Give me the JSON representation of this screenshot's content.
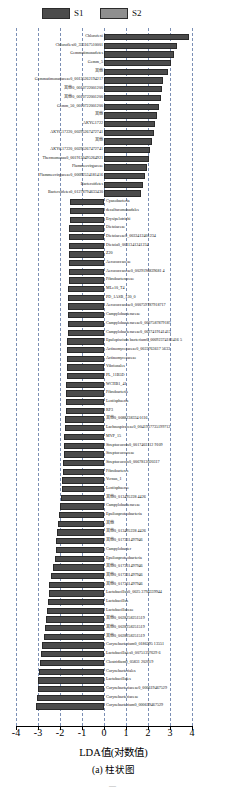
{
  "legend": {
    "items": [
      {
        "label": "S1",
        "color": "#4b4b4b"
      },
      {
        "label": "S2",
        "color": "#8f8f8f"
      }
    ]
  },
  "axis": {
    "xlabel": "LDA值(对数值)",
    "ticks": [
      "-4",
      "-3",
      "-2",
      "-1",
      "0",
      "1",
      "2",
      "3",
      "4"
    ],
    "xmin": -4,
    "xmax": 4
  },
  "caption": "(a) 柱状图",
  "pagemark": "—",
  "chart_data": {
    "type": "bar",
    "title": "",
    "xlabel": "LDA值(对数值)",
    "ylabel": "",
    "xlim": [
      -4,
      4
    ],
    "grid": true,
    "legend_position": "top-left",
    "orientation": "horizontal",
    "series": [
      {
        "name": "S1",
        "color": "#4b4b4b"
      },
      {
        "name": "S2",
        "color": "#8f8f8f"
      }
    ],
    "categories": [
      "Chlorofexi",
      "Chloroflexi0_353167510001",
      "Gemmatimonadetes",
      "Gemm_5",
      "其他",
      "Gemmatimonadaceae0_00135262194217",
      "其他0_0010722001200",
      "其他0_0010722001200",
      "Gemm_50_0010722001200",
      "其他",
      "AKYG1722",
      "AKYG17220_00295267472741",
      "其他",
      "AKYG17220_00295267472741",
      "Thermomonas0_0019130495264921",
      "Flammeovirgaceae",
      "Flammeovirgaceae0_00092534181416",
      "Bacteroidetes",
      "Bacteroidetes0_01278794633430",
      "Cyanobacteria",
      "desulfuromonadales",
      "Erysipelotrichi",
      "Dietziaceae",
      "Dietziaceae0_0033412401234",
      "Dietzia0_0031341241234",
      "Z20",
      "Aerococcaceae",
      "Aerococcaceae0_0029196839681 4",
      "Fibrobacteraceae",
      "MLe10_T4",
      "PD_1ASB_130_0",
      "Aerococcaceae0_000759787918717",
      "Campylobacteraceae",
      "Campylobacteraceae0_0007587879187",
      "Campylobacteraceae0_0027419141413",
      "Epulopiscium bacterium0_00092374181416 5",
      "Actinomycetaceae0_0022763617 5633",
      "Actinomycetaceae",
      "Vibrionales",
      "PL_11B5D",
      "WCHB1_41",
      "Fibrobacteria",
      "Lentisphaeria",
      "RF3",
      "其他0_0088238334 0116",
      "Lachnospiraceae0_0041937735199712",
      "MVP_15",
      "Streptococcus0_0017403112 9109",
      "Streptococcaceae",
      "Streptococcus0_0067813020317",
      "Fibrobacteres",
      "Vernus_1",
      "Lentisphaerae",
      "其他0_013495228 4426",
      "Campylobacteraceae",
      "Epsilonproteobacteria",
      "其他",
      "其他0_013495228 4426",
      "其他0_017331497946",
      "Campylobacter",
      "Epsilonproteobacteria",
      "其他0_017331497946",
      "其他0_017331497946",
      "其他0_017331497946",
      "Lactobacillus0_0025 3794339944",
      "Lactobacillus",
      "Lactobacillaceae",
      "其他0_0028258251519",
      "其他0_0028258251519",
      "其他0_0028258251519",
      "Corynebacterium0_0186295 13551",
      "Lactobacillales0_00751397629 6",
      "Clostridium0_05831 202019",
      "Corynebacteriales",
      "Lactobacillales",
      "Corynebacteriaceae0_000619467529",
      "Corynebacteriaceae",
      "Corynebacterium0_000619467529"
    ],
    "values": [
      3.88,
      3.32,
      3.18,
      3.05,
      2.93,
      2.7,
      2.62,
      2.58,
      2.52,
      2.4,
      2.32,
      2.25,
      2.18,
      2.11,
      2.05,
      1.97,
      1.88,
      1.78,
      1.68,
      -1.55,
      -1.55,
      -1.56,
      -1.57,
      -1.58,
      -1.58,
      -1.59,
      -1.6,
      -1.6,
      -1.61,
      -1.62,
      -1.62,
      -1.63,
      -1.64,
      -1.64,
      -1.65,
      -1.66,
      -1.67,
      -1.68,
      -1.69,
      -1.7,
      -1.71,
      -1.72,
      -1.73,
      -1.74,
      -1.76,
      -1.78,
      -1.8,
      -1.82,
      -1.84,
      -1.86,
      -1.88,
      -1.9,
      -1.93,
      -1.96,
      -2.0,
      -2.04,
      -2.08,
      -2.12,
      -2.16,
      -2.2,
      -2.25,
      -2.32,
      -2.4,
      -2.48,
      -2.52,
      -2.56,
      -2.6,
      -2.64,
      -2.68,
      -2.72,
      -2.8,
      -2.86,
      -2.9,
      -2.95,
      -2.98,
      -3.02,
      -3.06,
      -3.1
    ],
    "group": [
      "S1",
      "S1",
      "S1",
      "S1",
      "S1",
      "S1",
      "S1",
      "S1",
      "S1",
      "S1",
      "S1",
      "S1",
      "S1",
      "S1",
      "S1",
      "S1",
      "S1",
      "S1",
      "S1",
      "S2",
      "S2",
      "S2",
      "S2",
      "S2",
      "S2",
      "S2",
      "S2",
      "S2",
      "S2",
      "S2",
      "S2",
      "S2",
      "S2",
      "S2",
      "S2",
      "S2",
      "S2",
      "S2",
      "S2",
      "S2",
      "S2",
      "S2",
      "S2",
      "S2",
      "S2",
      "S2",
      "S2",
      "S2",
      "S2",
      "S2",
      "S2",
      "S2",
      "S2",
      "S2",
      "S2",
      "S2",
      "S2",
      "S2",
      "S2",
      "S2",
      "S2",
      "S2",
      "S2",
      "S2",
      "S2",
      "S2",
      "S2",
      "S2",
      "S2",
      "S2",
      "S2",
      "S2",
      "S2",
      "S2",
      "S2",
      "S2",
      "S2",
      "S2"
    ]
  }
}
